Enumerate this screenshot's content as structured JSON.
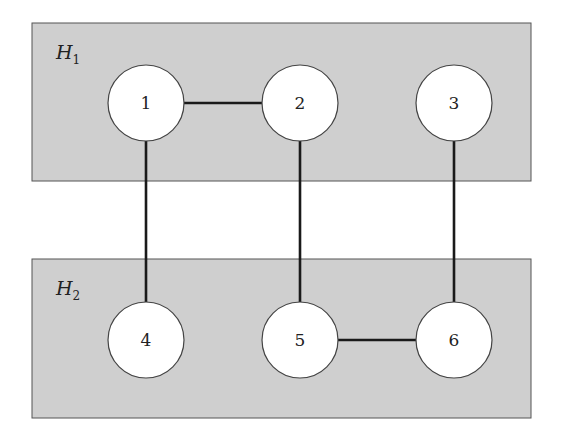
{
  "diagram": {
    "type": "graph-with-hyperedges",
    "groups": [
      {
        "id": "H1",
        "label_main": "H",
        "label_sub": "1",
        "x": 32,
        "y": 23,
        "width": 499,
        "height": 158,
        "color": "#cfcfcf",
        "members": [
          "1",
          "2",
          "3"
        ]
      },
      {
        "id": "H2",
        "label_main": "H",
        "label_sub": "2",
        "x": 32,
        "y": 259,
        "width": 499,
        "height": 159,
        "color": "#cfcfcf",
        "members": [
          "4",
          "5",
          "6"
        ]
      }
    ],
    "nodes": [
      {
        "id": "1",
        "label": "1",
        "cx": 146,
        "cy": 103,
        "r": 38
      },
      {
        "id": "2",
        "label": "2",
        "cx": 300,
        "cy": 103,
        "r": 38
      },
      {
        "id": "3",
        "label": "3",
        "cx": 454,
        "cy": 103,
        "r": 38
      },
      {
        "id": "4",
        "label": "4",
        "cx": 146,
        "cy": 340,
        "r": 38
      },
      {
        "id": "5",
        "label": "5",
        "cx": 300,
        "cy": 340,
        "r": 38
      },
      {
        "id": "6",
        "label": "6",
        "cx": 454,
        "cy": 340,
        "r": 38
      }
    ],
    "edges": [
      {
        "from": "1",
        "to": "2"
      },
      {
        "from": "1",
        "to": "4"
      },
      {
        "from": "2",
        "to": "5"
      },
      {
        "from": "3",
        "to": "6"
      },
      {
        "from": "5",
        "to": "6"
      }
    ]
  }
}
